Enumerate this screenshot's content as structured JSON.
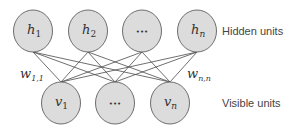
{
  "diagram": {
    "type": "restricted-boltzmann-machine",
    "hidden_layer": {
      "label": "Hidden units",
      "nodes": [
        {
          "id": "h1",
          "base": "h",
          "sub": "1",
          "cx": 33,
          "cy": 31
        },
        {
          "id": "h2",
          "base": "h",
          "sub": "2",
          "cx": 88,
          "cy": 31
        },
        {
          "id": "hdots",
          "base": "•••",
          "sub": "",
          "cx": 142,
          "cy": 31
        },
        {
          "id": "hn",
          "base": "h",
          "sub": "n",
          "cx": 197,
          "cy": 31
        }
      ]
    },
    "visible_layer": {
      "label": "Visible units",
      "nodes": [
        {
          "id": "v1",
          "base": "v",
          "sub": "1",
          "cx": 61,
          "cy": 103
        },
        {
          "id": "vdots",
          "base": "•••",
          "sub": "",
          "cx": 115,
          "cy": 103
        },
        {
          "id": "vn",
          "base": "v",
          "sub": "n",
          "cx": 170,
          "cy": 103
        }
      ]
    },
    "weights": [
      {
        "base": "w",
        "sub": "1,1",
        "x": 20,
        "y": 78
      },
      {
        "base": "w",
        "sub": "n,n",
        "x": 187,
        "y": 78
      }
    ],
    "connectivity": "fully connected between hidden and visible layers",
    "colors": {
      "node_fill": "#dcdcdc",
      "node_stroke": "#6e6e6e",
      "edge": "#4a4a4a",
      "text": "#333333"
    }
  }
}
